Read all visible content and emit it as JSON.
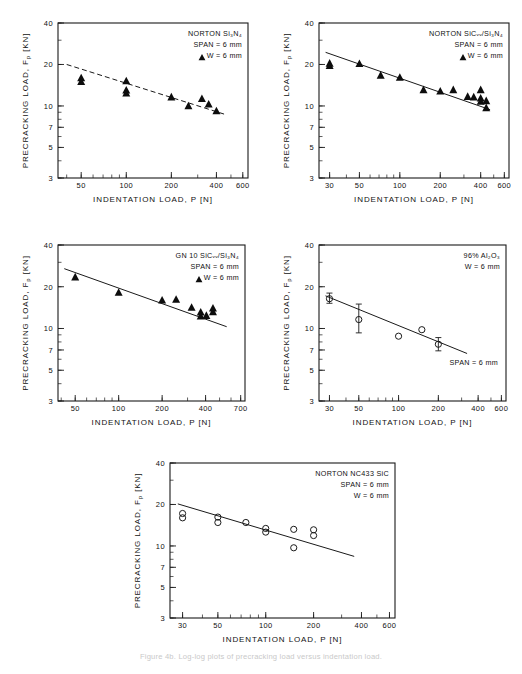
{
  "figure": {
    "xlabel": "INDENTATION  LOAD,  P [N]",
    "ylabel": "PRECRACKING  LOAD,  F",
    "ylabel_sub": "p",
    "ylabel_unit": " [KN]",
    "caption_faint": "Figure 4b. Log-log plots of precracking load versus indentation load."
  },
  "chart_data": [
    {
      "id": "norton-si3n4",
      "type": "scatter",
      "title": "NORTON  Si3N4",
      "legend": [
        "NORTON  Si₃N₄",
        "SPAN = 6 mm",
        "W = 6 mm"
      ],
      "marker": "triangle",
      "fit_style": "dashed",
      "xlabel": "INDENTATION  LOAD,  P [N]",
      "ylabel": "PRECRACKING  LOAD,  Fₚ [KN]",
      "xticks": [
        50,
        100,
        200,
        400,
        600
      ],
      "xticklabels": [
        "50",
        "100",
        "200",
        "400",
        "600"
      ],
      "yticks": [
        3,
        5,
        7,
        10,
        20,
        40
      ],
      "yticklabels": [
        "3",
        "5",
        "7",
        "10",
        "20",
        "40"
      ],
      "xlim": [
        35,
        650
      ],
      "ylim": [
        3,
        40
      ],
      "fit_line": {
        "x": [
          40,
          470
        ],
        "y": [
          20.0,
          8.6
        ]
      },
      "points": [
        {
          "x": 50,
          "y": 16.0
        },
        {
          "x": 50,
          "y": 15.0
        },
        {
          "x": 100,
          "y": 15.2
        },
        {
          "x": 100,
          "y": 13.0
        },
        {
          "x": 100,
          "y": 12.4
        },
        {
          "x": 200,
          "y": 11.6
        },
        {
          "x": 260,
          "y": 10.0
        },
        {
          "x": 320,
          "y": 11.3
        },
        {
          "x": 355,
          "y": 10.3
        },
        {
          "x": 400,
          "y": 9.2
        }
      ]
    },
    {
      "id": "norton-sicw-si3n4",
      "type": "scatter",
      "title": "NORTON  SiCw/Si3N4",
      "legend": [
        "NORTON  SiCᵥᵥ/Si₃N₄",
        "SPAN = 6 mm",
        "W = 6 mm"
      ],
      "marker": "triangle",
      "fit_style": "solid",
      "xlabel": "INDENTATION  LOAD,  P [N]",
      "ylabel": "PRECRACKING  LOAD,  Fₚ [KN]",
      "xticks": [
        30,
        50,
        100,
        200,
        400,
        600
      ],
      "xticklabels": [
        "30",
        "50",
        "100",
        "200",
        "400",
        "600"
      ],
      "yticks": [
        3,
        5,
        7,
        10,
        20,
        40
      ],
      "yticklabels": [
        "3",
        "5",
        "7",
        "10",
        "20",
        "40"
      ],
      "xlim": [
        25,
        650
      ],
      "ylim": [
        3,
        40
      ],
      "fit_line": {
        "x": [
          28,
          470
        ],
        "y": [
          24.5,
          9.4
        ]
      },
      "points": [
        {
          "x": 30,
          "y": 20.4
        },
        {
          "x": 30,
          "y": 19.6
        },
        {
          "x": 50,
          "y": 20.3
        },
        {
          "x": 72,
          "y": 16.7
        },
        {
          "x": 100,
          "y": 16.1
        },
        {
          "x": 150,
          "y": 13.1
        },
        {
          "x": 200,
          "y": 12.8
        },
        {
          "x": 250,
          "y": 13.1
        },
        {
          "x": 320,
          "y": 11.7
        },
        {
          "x": 355,
          "y": 11.6
        },
        {
          "x": 400,
          "y": 11.4
        },
        {
          "x": 400,
          "y": 10.8
        },
        {
          "x": 400,
          "y": 13.1
        },
        {
          "x": 440,
          "y": 10.9
        },
        {
          "x": 440,
          "y": 9.7
        }
      ]
    },
    {
      "id": "gn10-sicw-si3n4",
      "type": "scatter",
      "title": "GN 10  SiCw/Si3N4",
      "legend": [
        "GN 10  SiCᵥᵥ/Si₃N₄",
        "SPAN = 6 mm",
        "W = 6 mm"
      ],
      "marker": "triangle",
      "fit_style": "solid",
      "xlabel": "INDENTATION  LOAD,  P [N]",
      "ylabel": "PRECRACKING  LOAD,  Fₚ [KN]",
      "xticks": [
        50,
        100,
        200,
        400,
        700
      ],
      "xticklabels": [
        "50",
        "100",
        "200",
        "400",
        "700"
      ],
      "yticks": [
        3,
        5,
        7,
        10,
        20,
        40
      ],
      "yticklabels": [
        "3",
        "5",
        "7",
        "10",
        "20",
        "40"
      ],
      "xlim": [
        38,
        750
      ],
      "ylim": [
        3,
        40
      ],
      "fit_line": {
        "x": [
          42,
          560
        ],
        "y": [
          27.0,
          10.3
        ]
      },
      "points": [
        {
          "x": 50,
          "y": 23.5
        },
        {
          "x": 100,
          "y": 18.2
        },
        {
          "x": 200,
          "y": 16.0
        },
        {
          "x": 250,
          "y": 16.2
        },
        {
          "x": 320,
          "y": 14.2
        },
        {
          "x": 370,
          "y": 13.1
        },
        {
          "x": 370,
          "y": 12.3
        },
        {
          "x": 405,
          "y": 12.4
        },
        {
          "x": 450,
          "y": 14.0
        },
        {
          "x": 450,
          "y": 13.2
        }
      ]
    },
    {
      "id": "al2o3-96",
      "type": "scatter",
      "title": "96% Al2O3",
      "legend": [
        "96% Al₂O₃",
        "W = 6 mm"
      ],
      "annotation": "SPAN = 6 mm",
      "marker": "circle",
      "fit_style": "solid",
      "xlabel": "INDENTATION  LOAD,  P [N]",
      "ylabel": "PRECRACKING  LOAD,  Fₚ [KN]",
      "xticks": [
        30,
        50,
        100,
        200,
        400,
        600
      ],
      "xticklabels": [
        "30",
        "50",
        "100",
        "200",
        "400",
        "600"
      ],
      "yticks": [
        3,
        5,
        7,
        10,
        20,
        40
      ],
      "yticklabels": [
        "3",
        "5",
        "7",
        "10",
        "20",
        "40"
      ],
      "xlim": [
        25,
        650
      ],
      "ylim": [
        3,
        40
      ],
      "fit_line": {
        "x": [
          28,
          330
        ],
        "y": [
          17.2,
          6.6
        ]
      },
      "points": [
        {
          "x": 30,
          "y": 16.4,
          "err_lo": 15.2,
          "err_hi": 18.0
        },
        {
          "x": 50,
          "y": 11.6,
          "err_lo": 9.3,
          "err_hi": 15.0
        },
        {
          "x": 100,
          "y": 8.8
        },
        {
          "x": 150,
          "y": 9.8
        },
        {
          "x": 200,
          "y": 7.7,
          "err_lo": 6.9,
          "err_hi": 8.6
        }
      ]
    },
    {
      "id": "norton-nc433-sic",
      "type": "scatter",
      "title": "NORTON  NC433 SiC",
      "legend": [
        "NORTON  NC433 SiC",
        "SPAN = 6 mm",
        "W = 6 mm"
      ],
      "marker": "circle",
      "fit_style": "solid",
      "xlabel": "INDENTATION  LOAD,  P [N]",
      "ylabel": "PRECRACKING  LOAD,  Fₚ [KN]",
      "xticks": [
        30,
        50,
        100,
        200,
        400,
        600
      ],
      "xticklabels": [
        "30",
        "50",
        "100",
        "200",
        "400",
        "600"
      ],
      "yticks": [
        3,
        5,
        7,
        10,
        20,
        40
      ],
      "yticklabels": [
        "3",
        "5",
        "7",
        "10",
        "20",
        "40"
      ],
      "xlim": [
        25,
        650
      ],
      "ylim": [
        3,
        40
      ],
      "fit_line": {
        "x": [
          28,
          360
        ],
        "y": [
          20.2,
          8.4
        ]
      },
      "points": [
        {
          "x": 30,
          "y": 17.2
        },
        {
          "x": 30,
          "y": 16.0
        },
        {
          "x": 50,
          "y": 16.2
        },
        {
          "x": 50,
          "y": 14.8
        },
        {
          "x": 75,
          "y": 14.8
        },
        {
          "x": 100,
          "y": 13.4
        },
        {
          "x": 100,
          "y": 12.6
        },
        {
          "x": 150,
          "y": 13.2
        },
        {
          "x": 150,
          "y": 9.7
        },
        {
          "x": 200,
          "y": 13.1
        },
        {
          "x": 200,
          "y": 11.9
        }
      ]
    }
  ]
}
